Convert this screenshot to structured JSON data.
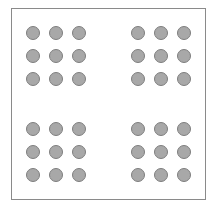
{
  "diagram": {
    "colors": {
      "frame": "#8a8a8a",
      "dot_fill": "#a8a8a8",
      "dot_stroke": "#7e7e7e",
      "background": "#ffffff"
    },
    "groups": [
      {
        "name": "top-left",
        "columns_x": [
          33,
          56,
          79
        ],
        "rows_y": [
          33,
          56,
          79
        ]
      },
      {
        "name": "top-right",
        "columns_x": [
          138,
          161,
          184
        ],
        "rows_y": [
          33,
          56,
          79
        ]
      },
      {
        "name": "bottom-left",
        "columns_x": [
          33,
          56,
          79
        ],
        "rows_y": [
          129,
          152,
          175
        ]
      },
      {
        "name": "bottom-right",
        "columns_x": [
          138,
          161,
          184
        ],
        "rows_y": [
          129,
          152,
          175
        ]
      }
    ],
    "dot_diameter": 14
  }
}
